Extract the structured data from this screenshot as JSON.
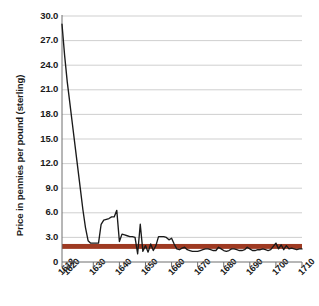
{
  "chart_data": {
    "type": "line",
    "title": "",
    "xlabel": "",
    "ylabel": "Price in pennies per pound (sterling)",
    "xlim": [
      1618,
      1710
    ],
    "ylim": [
      0,
      30
    ],
    "grid": true,
    "legend": "none",
    "y_ticks": [
      "0",
      "3.0",
      "6.0",
      "9.0",
      "12.0",
      "15.0",
      "18.0",
      "21.0",
      "24.0",
      "27.0",
      "30.0"
    ],
    "y_tick_values": [
      0,
      3,
      6,
      9,
      12,
      15,
      18,
      21,
      24,
      27,
      30
    ],
    "x_ticks": [
      "1618",
      "1620",
      "1630",
      "1640",
      "1650",
      "1660",
      "1670",
      "1680",
      "1690",
      "1700",
      "1710"
    ],
    "x_tick_values": [
      1618,
      1620,
      1630,
      1640,
      1650,
      1660,
      1670,
      1680,
      1690,
      1700,
      1710
    ],
    "series": [
      {
        "name": "Price in pennies per pound",
        "color": "#1a1a1a",
        "x": [
          1618,
          1619,
          1620,
          1621,
          1622,
          1623,
          1624,
          1625,
          1626,
          1627,
          1628,
          1629,
          1630,
          1631,
          1632,
          1633,
          1634,
          1635,
          1636,
          1637,
          1638,
          1639,
          1640,
          1641,
          1642,
          1643,
          1644,
          1645,
          1646,
          1647,
          1648,
          1649,
          1650,
          1651,
          1652,
          1653,
          1654,
          1655,
          1656,
          1657,
          1658,
          1659,
          1660,
          1661,
          1662,
          1663,
          1664,
          1665,
          1666,
          1667,
          1668,
          1669,
          1670,
          1671,
          1672,
          1673,
          1674,
          1675,
          1676,
          1677,
          1678,
          1679,
          1680,
          1681,
          1682,
          1683,
          1684,
          1685,
          1686,
          1687,
          1688,
          1689,
          1690,
          1691,
          1692,
          1693,
          1694,
          1695,
          1696,
          1697,
          1698,
          1699,
          1700,
          1701,
          1702,
          1703,
          1704,
          1705,
          1706,
          1707,
          1708,
          1709,
          1710
        ],
        "values": [
          29.0,
          25.2,
          22.0,
          19.4,
          16.8,
          14.2,
          11.6,
          9.0,
          6.4,
          4.2,
          2.6,
          2.3,
          2.3,
          2.3,
          2.3,
          4.6,
          5.1,
          5.2,
          5.3,
          5.5,
          5.5,
          6.3,
          2.5,
          3.4,
          3.3,
          3.2,
          3.1,
          3.1,
          3.0,
          1.0,
          4.6,
          1.3,
          2.0,
          1.2,
          2.2,
          1.4,
          2.0,
          3.1,
          3.1,
          3.1,
          3.0,
          2.7,
          2.9,
          2.2,
          1.6,
          1.5,
          1.7,
          1.8,
          1.5,
          1.4,
          1.3,
          1.3,
          1.3,
          1.4,
          1.5,
          1.6,
          1.6,
          1.5,
          1.4,
          1.4,
          1.8,
          1.6,
          1.4,
          1.3,
          1.4,
          1.6,
          1.6,
          1.5,
          1.4,
          1.4,
          1.5,
          1.8,
          1.6,
          1.4,
          1.4,
          1.5,
          1.5,
          1.6,
          1.5,
          1.4,
          1.5,
          1.9,
          2.3,
          1.6,
          2.1,
          1.5,
          2.0,
          1.6,
          1.7,
          1.6,
          1.5,
          1.6,
          1.6
        ]
      }
    ],
    "bands": [
      {
        "name": "reference-band",
        "color": "#9e3a22",
        "y_low": 1.6,
        "y_high": 2.2
      }
    ]
  }
}
